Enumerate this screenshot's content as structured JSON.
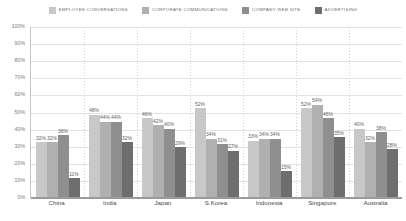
{
  "chart_data": {
    "type": "bar",
    "title": "",
    "xlabel": "",
    "ylabel": "",
    "ylim": [
      0,
      100
    ],
    "ytick_labels": [
      "100%",
      "90%",
      "80%",
      "70%",
      "60%",
      "50%",
      "40%",
      "30%",
      "20%",
      "10%",
      "0%"
    ],
    "yticks": [
      100,
      90,
      80,
      70,
      60,
      50,
      40,
      30,
      20,
      10,
      0
    ],
    "grid": true,
    "legend_position": "top",
    "categories": [
      "China",
      "India",
      "Japan",
      "S.Korea",
      "Indonesia",
      "Singapore",
      "Australia"
    ],
    "series": [
      {
        "name": "EMPLOYEE CONVERSATIONS",
        "color": "#c8c8c8",
        "values": [
          32,
          48,
          46,
          52,
          33,
          52,
          40
        ],
        "labels": [
          "32%",
          "48%",
          "46%",
          "52%",
          "33%",
          "52%",
          "40%"
        ]
      },
      {
        "name": "CORPORATE COMMUNICATIONS",
        "color": "#b0b0b0",
        "values": [
          32,
          44,
          42,
          34,
          34,
          54,
          32
        ],
        "labels": [
          "32%",
          "44%",
          "42%",
          "34%",
          "34%",
          "54%",
          "32%"
        ]
      },
      {
        "name": "COMPANY WEB SITE",
        "color": "#8f8f8f",
        "values": [
          36,
          44,
          40,
          31,
          34,
          46,
          38
        ],
        "labels": [
          "36%",
          "44%",
          "40%",
          "31%",
          "34%",
          "46%",
          "38%"
        ]
      },
      {
        "name": "ADVERTISING",
        "color": "#6e6e6e",
        "values": [
          11,
          32,
          29,
          27,
          15,
          35,
          28
        ],
        "labels": [
          "11%",
          "32%",
          "29%",
          "27%",
          "15%",
          "35%",
          "28%"
        ]
      }
    ]
  }
}
